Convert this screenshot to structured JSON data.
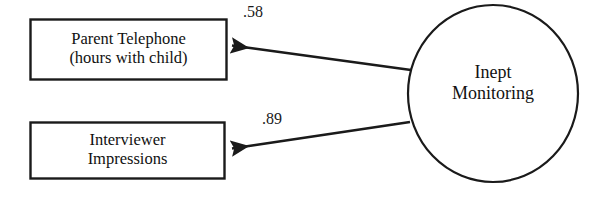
{
  "diagram": {
    "type": "sem-path-diagram",
    "background_color": "#ffffff",
    "stroke_color": "#1a1a1a",
    "latent_variable": {
      "shape": "ellipse",
      "label_line1": "Inept",
      "label_line2": "Monitoring"
    },
    "indicators": [
      {
        "shape": "rectangle",
        "label_line1": "Parent Telephone",
        "label_line2": "(hours with child)"
      },
      {
        "shape": "rectangle",
        "label_line1": "Interviewer",
        "label_line2": "Impressions"
      }
    ],
    "paths": [
      {
        "from": "Inept Monitoring",
        "to": "Parent Telephone (hours with child)",
        "coefficient": ".58"
      },
      {
        "from": "Inept Monitoring",
        "to": "Interviewer Impressions",
        "coefficient": ".89"
      }
    ]
  }
}
